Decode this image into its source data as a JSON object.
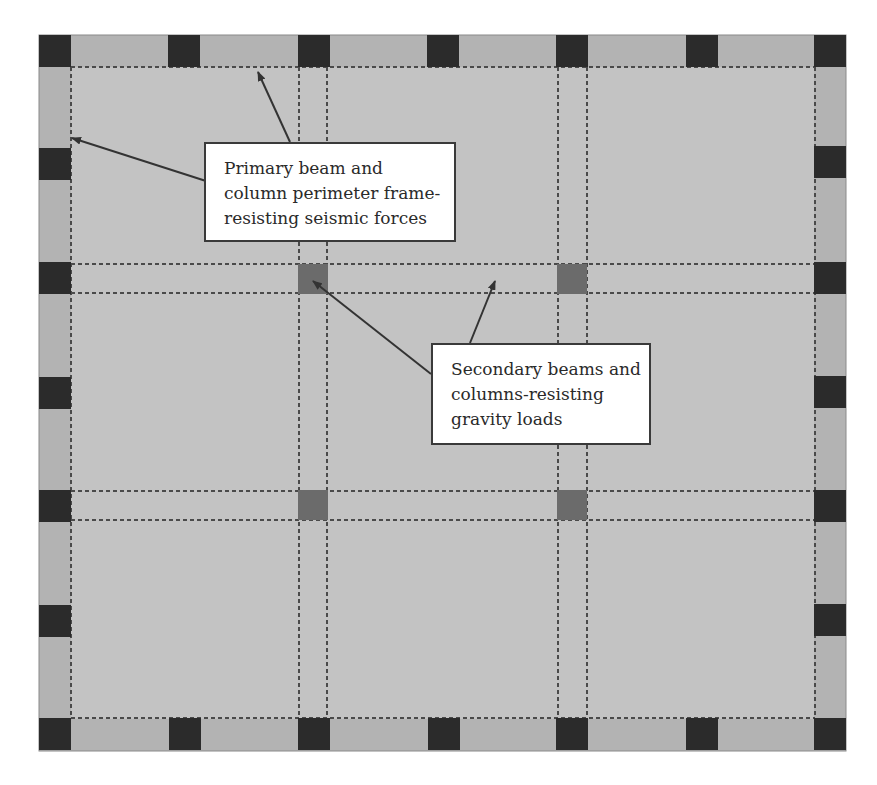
{
  "diagram": {
    "type": "structural floor plan",
    "colors": {
      "background": "#ffffff",
      "floor": "#c3c3c3",
      "perimeter_strip": "#b3b3b3",
      "perimeter_column": "#2b2b2b",
      "interior_column": "#6b6b6b",
      "gridline": "#4a4a4a",
      "arrow": "#333333",
      "callout_border": "#3a3a3a"
    },
    "outline": {
      "x": 39,
      "y": 35,
      "width": 807,
      "height": 716
    },
    "perimeter_strip_width": 32,
    "grid_lines": {
      "vertical_x": [
        71,
        299,
        327,
        558,
        587,
        815
      ],
      "horizontal_y": [
        67,
        264,
        293,
        491,
        520,
        718
      ]
    },
    "perimeter_columns": [
      {
        "x": 39,
        "y": 35
      },
      {
        "x": 168,
        "y": 35
      },
      {
        "x": 298,
        "y": 35
      },
      {
        "x": 427,
        "y": 35
      },
      {
        "x": 556,
        "y": 35
      },
      {
        "x": 686,
        "y": 35
      },
      {
        "x": 814,
        "y": 35
      },
      {
        "x": 39,
        "y": 718
      },
      {
        "x": 169,
        "y": 718
      },
      {
        "x": 298,
        "y": 718
      },
      {
        "x": 428,
        "y": 718
      },
      {
        "x": 556,
        "y": 718
      },
      {
        "x": 686,
        "y": 718
      },
      {
        "x": 814,
        "y": 718
      },
      {
        "x": 39,
        "y": 148
      },
      {
        "x": 39,
        "y": 262
      },
      {
        "x": 39,
        "y": 377
      },
      {
        "x": 39,
        "y": 490
      },
      {
        "x": 39,
        "y": 605
      },
      {
        "x": 814,
        "y": 146
      },
      {
        "x": 814,
        "y": 262
      },
      {
        "x": 814,
        "y": 376
      },
      {
        "x": 814,
        "y": 490
      },
      {
        "x": 814,
        "y": 604
      }
    ],
    "interior_columns": [
      {
        "x": 298,
        "y": 264
      },
      {
        "x": 557,
        "y": 264
      },
      {
        "x": 298,
        "y": 490
      },
      {
        "x": 557,
        "y": 490
      }
    ]
  },
  "callouts": [
    {
      "id": "primary",
      "lines": [
        "Primary beam and",
        "column perimeter frame-",
        "resisting seismic forces"
      ],
      "box": {
        "x": 204,
        "y": 142,
        "width": 252,
        "height": 100
      },
      "arrows": [
        {
          "from": [
            206,
            181
          ],
          "to": [
            72,
            138
          ]
        },
        {
          "from": [
            290,
            142
          ],
          "to": [
            258,
            72
          ]
        }
      ]
    },
    {
      "id": "secondary",
      "lines": [
        "Secondary beams and",
        "columns-resisting",
        "gravity loads"
      ],
      "box": {
        "x": 431,
        "y": 343,
        "width": 220,
        "height": 102
      },
      "arrows": [
        {
          "from": [
            431,
            374
          ],
          "to": [
            313,
            281
          ]
        },
        {
          "from": [
            470,
            343
          ],
          "to": [
            495,
            281
          ]
        }
      ]
    }
  ]
}
